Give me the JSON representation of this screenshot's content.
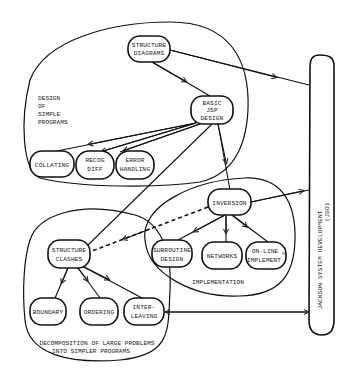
{
  "diagram": {
    "title": "",
    "regions": {
      "simple": [
        "DESIGN",
        "OF",
        "SIMPLE",
        "PROGRAMS"
      ],
      "implementation": "IMPLEMENTATION",
      "decomposition": [
        "DECOMPOSITION OF LARGE PROBLEMS",
        "INTO SIMPLER PROGRAMS"
      ]
    },
    "jsd": {
      "line1": "JACKSON SYSTEM DEVELOPMENT",
      "line2": "(JSD)"
    },
    "nodes": {
      "structure_diagrams": [
        "STRUCTURE",
        "DIAGRAMS"
      ],
      "basic_jsp": [
        "BASIC",
        "JSP",
        "DESIGN"
      ],
      "collating": [
        "COLLATING"
      ],
      "recog_diff": [
        "RECOG",
        "DIFF"
      ],
      "error_handling": [
        "ERROR",
        "HANDLING"
      ],
      "inversion": [
        "INVERSION"
      ],
      "subroutine_design": [
        "SUBROUTINE",
        "DESIGN"
      ],
      "networks": [
        "NETWORKS"
      ],
      "online_impl": [
        "ON-LINE",
        "IMPLEMENT"
      ],
      "online_impl_sup": "n",
      "structure_clashes": [
        "STRUCTURE",
        "CLASHES"
      ],
      "boundary": [
        "BOUNDARY"
      ],
      "ordering": [
        "ORDERING"
      ],
      "interleaving": [
        "INTER-",
        "LEAVING"
      ]
    },
    "edges": [
      {
        "from": "STRUCTURE DIAGRAMS",
        "to": "BASIC JSP DESIGN",
        "style": "solid"
      },
      {
        "from": "STRUCTURE DIAGRAMS",
        "to": "JSD",
        "style": "solid"
      },
      {
        "from": "BASIC JSP DESIGN",
        "to": "COLLATING",
        "style": "solid"
      },
      {
        "from": "BASIC JSP DESIGN",
        "to": "RECOG DIFF",
        "style": "solid"
      },
      {
        "from": "BASIC JSP DESIGN",
        "to": "ERROR HANDLING",
        "style": "solid"
      },
      {
        "from": "BASIC JSP DESIGN",
        "to": "INVERSION",
        "style": "solid"
      },
      {
        "from": "BASIC JSP DESIGN",
        "to": "STRUCTURE CLASHES",
        "style": "solid"
      },
      {
        "from": "INVERSION",
        "to": "JSD",
        "style": "solid"
      },
      {
        "from": "INVERSION",
        "to": "SUBROUTINE DESIGN",
        "style": "solid"
      },
      {
        "from": "INVERSION",
        "to": "NETWORKS",
        "style": "solid"
      },
      {
        "from": "INVERSION",
        "to": "ON-LINE IMPLEMENTn",
        "style": "solid"
      },
      {
        "from": "INVERSION",
        "to": "STRUCTURE CLASHES",
        "style": "dashed"
      },
      {
        "from": "STRUCTURE CLASHES",
        "to": "BOUNDARY",
        "style": "solid"
      },
      {
        "from": "STRUCTURE CLASHES",
        "to": "ORDERING",
        "style": "solid"
      },
      {
        "from": "STRUCTURE CLASHES",
        "to": "INTER-LEAVING",
        "style": "solid"
      },
      {
        "from": "INTER-LEAVING",
        "to": "JSD",
        "style": "bidirectional"
      }
    ]
  }
}
